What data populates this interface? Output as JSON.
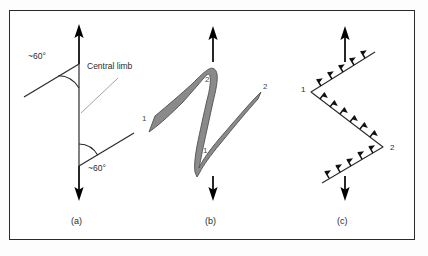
{
  "figure": {
    "background_color": "#ffffff",
    "frame_color": "#2a2a2a",
    "line_color": "#2b2b2b",
    "band_fill_color": "#8a8a8a",
    "band_outline_color": "#4f4f4f",
    "arrow_color": "#000000"
  },
  "panels": [
    {
      "id": "a",
      "caption": "(a)",
      "type": "line-diagram",
      "annotations": [
        {
          "name": "angle-top",
          "text": "~60°"
        },
        {
          "name": "angle-bottom",
          "text": "~60°"
        },
        {
          "name": "central-limb",
          "text": "Central limb"
        }
      ],
      "arrows": [
        {
          "name": "arrow-up",
          "direction": "up"
        },
        {
          "name": "arrow-down",
          "direction": "down"
        }
      ]
    },
    {
      "id": "b",
      "caption": "(b)",
      "type": "folded-band",
      "limb_labels": [
        {
          "name": "label-lower-left-1",
          "text": "1"
        },
        {
          "name": "label-upper-hinge-2",
          "text": "2"
        },
        {
          "name": "label-lower-hinge-1",
          "text": "1"
        },
        {
          "name": "label-upper-right-2",
          "text": "2"
        }
      ],
      "arrows": [
        {
          "name": "arrow-up",
          "direction": "up"
        },
        {
          "name": "arrow-down",
          "direction": "down"
        }
      ]
    },
    {
      "id": "c",
      "caption": "(c)",
      "type": "vergence-zigzag",
      "hinge_labels": [
        {
          "name": "label-hinge-1",
          "text": "1"
        },
        {
          "name": "label-hinge-2",
          "text": "2"
        }
      ],
      "arrows": [
        {
          "name": "arrow-up",
          "direction": "up"
        },
        {
          "name": "arrow-down",
          "direction": "down"
        }
      ],
      "barb_count": 22
    }
  ]
}
